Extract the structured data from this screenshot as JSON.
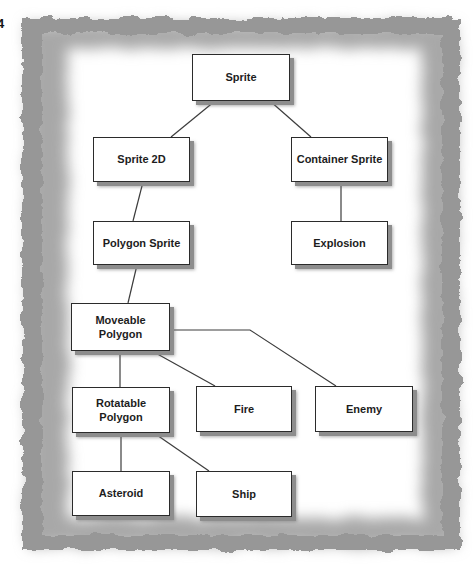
{
  "page": {
    "number": "4"
  },
  "diagram": {
    "nodes": [
      {
        "id": "sprite",
        "label": "Sprite"
      },
      {
        "id": "sprite-2d",
        "label": "Sprite 2D"
      },
      {
        "id": "container-sprite",
        "label": "Container Sprite"
      },
      {
        "id": "polygon-sprite",
        "label": "Polygon Sprite"
      },
      {
        "id": "explosion",
        "label": "Explosion"
      },
      {
        "id": "moveable-polygon",
        "label": "Moveable Polygon"
      },
      {
        "id": "rotatable-polygon",
        "label": "Rotatable Polygon"
      },
      {
        "id": "fire",
        "label": "Fire"
      },
      {
        "id": "enemy",
        "label": "Enemy"
      },
      {
        "id": "asteroid",
        "label": "Asteroid"
      },
      {
        "id": "ship",
        "label": "Ship"
      }
    ],
    "edges": [
      {
        "from": "sprite",
        "to": "sprite-2d"
      },
      {
        "from": "sprite",
        "to": "container-sprite"
      },
      {
        "from": "sprite-2d",
        "to": "polygon-sprite"
      },
      {
        "from": "container-sprite",
        "to": "explosion"
      },
      {
        "from": "polygon-sprite",
        "to": "moveable-polygon"
      },
      {
        "from": "moveable-polygon",
        "to": "rotatable-polygon"
      },
      {
        "from": "moveable-polygon",
        "to": "fire"
      },
      {
        "from": "moveable-polygon",
        "to": "enemy"
      },
      {
        "from": "rotatable-polygon",
        "to": "asteroid"
      },
      {
        "from": "rotatable-polygon",
        "to": "ship"
      }
    ],
    "colors": {
      "box_fill": "#ffffff",
      "box_border": "#2b2b2b",
      "box_shadow": "#8d8d8d",
      "connector_line": "#3c3c3c",
      "frame_gray": "#a0a0a0",
      "text": "#1d1d1d",
      "background": "#ffffff"
    }
  }
}
